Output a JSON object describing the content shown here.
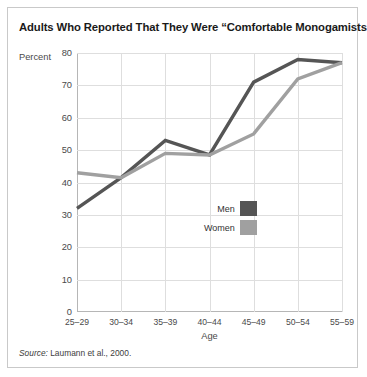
{
  "figure": {
    "title": "Adults Who Reported That They Were “Comfortable Monogamists”",
    "source_prefix": "Source:",
    "source_text": " Laumann et al., 2000."
  },
  "legend": {
    "position": "inside-center-right",
    "entries": [
      {
        "label": "Men",
        "color": "#555555"
      },
      {
        "label": "Women",
        "color": "#a0a0a0"
      }
    ]
  },
  "chart_data": {
    "type": "line",
    "title": "Adults Who Reported That They Were “Comfortable Monogamists”",
    "xlabel": "Age",
    "ylabel": "Percent",
    "categories": [
      "25–29",
      "30–34",
      "35–39",
      "40–44",
      "45–49",
      "50–54",
      "55–59"
    ],
    "ylim": [
      0,
      80
    ],
    "yticks": [
      0,
      10,
      20,
      30,
      40,
      50,
      60,
      70,
      80
    ],
    "grid": "both",
    "legend_position": "inside-center-right",
    "series": [
      {
        "name": "Men",
        "color": "#555555",
        "values": [
          32,
          41.5,
          53,
          48.5,
          71,
          78,
          77
        ]
      },
      {
        "name": "Women",
        "color": "#a0a0a0",
        "values": [
          43,
          41.5,
          49,
          48.5,
          55,
          72,
          77
        ]
      }
    ]
  }
}
